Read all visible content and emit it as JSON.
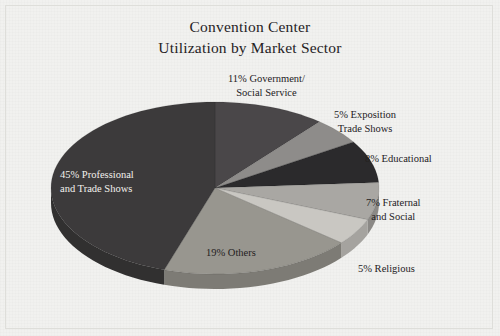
{
  "title": {
    "line1": "Convention Center",
    "line2": "Utilization by Market Sector"
  },
  "colors": {
    "background": "#f1f1ef",
    "frame": "#dededa",
    "text": "#24211e",
    "text_on_slice": "#f3f1ee",
    "slice_professional": "#3c3a3b",
    "slice_government": "#4a4749",
    "slice_exposition": "#8e8c8a",
    "slice_educational": "#2b2a2c",
    "slice_fraternal": "#a9a7a3",
    "slice_religious": "#c9c7c2",
    "slice_others": "#98968f"
  },
  "chart_data": {
    "type": "pie",
    "title": "Convention Center Utilization by Market Sector",
    "xlabel": "",
    "ylabel": "",
    "legend_position": "none",
    "grid": false,
    "start_angle_deg": 0,
    "direction": "clockwise",
    "three_d": true,
    "categories": [
      "Government/Social Service",
      "Exposition Trade Shows",
      "Educational",
      "Fraternal and Social",
      "Religious",
      "Others",
      "Professional and Trade Shows"
    ],
    "values": [
      11,
      5,
      8,
      7,
      5,
      19,
      45
    ],
    "unit": "percent",
    "total": 100,
    "slices": [
      {
        "label": "11% Government/ Social Service",
        "label_line1": "11% Government/",
        "label_line2": "Social Service",
        "category": "Government/Social Service",
        "value": 11,
        "color": "#4a4749",
        "label_placement": "outside-top"
      },
      {
        "label": "5% Exposition Trade Shows",
        "label_line1": "5% Exposition",
        "label_line2": "Trade Shows",
        "category": "Exposition Trade Shows",
        "value": 5,
        "color": "#8e8c8a",
        "label_placement": "outside-upper-right"
      },
      {
        "label": "8% Educational",
        "label_line1": "8% Educational",
        "label_line2": "",
        "category": "Educational",
        "value": 8,
        "color": "#2b2a2c",
        "label_placement": "outside-right"
      },
      {
        "label": "7% Fraternal and Social",
        "label_line1": "7% Fraternal",
        "label_line2": "and Social",
        "category": "Fraternal and Social",
        "value": 7,
        "color": "#a9a7a3",
        "label_placement": "outside-right"
      },
      {
        "label": "5% Religious",
        "label_line1": "5% Religious",
        "label_line2": "",
        "category": "Religious",
        "value": 5,
        "color": "#c9c7c2",
        "label_placement": "outside-lower-right"
      },
      {
        "label": "19% Others",
        "label_line1": "19% Others",
        "label_line2": "",
        "category": "Others",
        "value": 19,
        "color": "#98968f",
        "label_placement": "inside-bottom"
      },
      {
        "label": "45% Professional and Trade Shows",
        "label_line1": "45% Professional",
        "label_line2": "and Trade Shows",
        "category": "Professional and Trade Shows",
        "value": 45,
        "color": "#3c3a3b",
        "label_placement": "inside-left"
      }
    ]
  }
}
